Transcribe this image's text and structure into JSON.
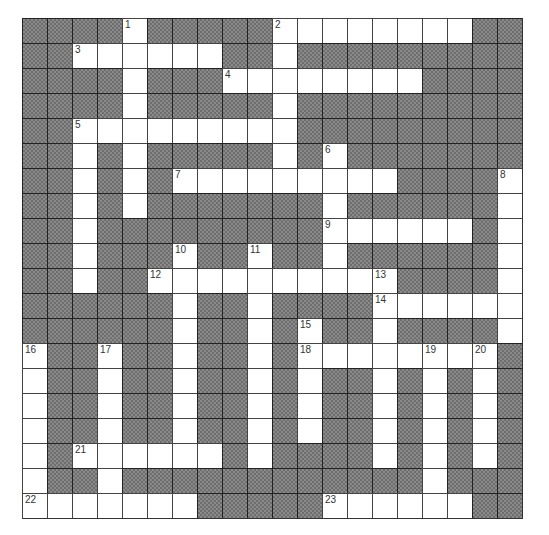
{
  "puzzle": {
    "rows": 20,
    "cols": 20,
    "colors": {
      "block": "#8a8a8a",
      "cell": "#ffffff",
      "line": "#444444"
    },
    "open_cells": {
      "0": [
        4,
        10,
        11,
        12,
        13,
        14,
        15,
        16,
        17
      ],
      "1": [
        2,
        3,
        4,
        5,
        6,
        7,
        10
      ],
      "2": [
        4,
        8,
        9,
        10,
        11,
        12,
        13,
        14,
        15
      ],
      "3": [
        4,
        10
      ],
      "4": [
        2,
        3,
        4,
        5,
        6,
        7,
        8,
        9,
        10
      ],
      "5": [
        2,
        4,
        10,
        12
      ],
      "6": [
        2,
        4,
        6,
        7,
        8,
        9,
        10,
        11,
        12,
        13,
        14,
        19
      ],
      "7": [
        2,
        4,
        12,
        19
      ],
      "8": [
        2,
        12,
        13,
        14,
        15,
        16,
        17,
        19
      ],
      "9": [
        2,
        6,
        9,
        12,
        19
      ],
      "10": [
        2,
        5,
        6,
        7,
        8,
        9,
        10,
        11,
        12,
        13,
        14,
        19
      ],
      "11": [
        6,
        9,
        14,
        15,
        16,
        17,
        18,
        19
      ],
      "12": [
        6,
        9,
        11,
        14,
        19
      ],
      "13": [
        0,
        3,
        6,
        9,
        11,
        12,
        13,
        14,
        15,
        16,
        17,
        18
      ],
      "14": [
        0,
        3,
        6,
        9,
        11,
        14,
        16,
        18
      ],
      "15": [
        0,
        3,
        6,
        9,
        11,
        14,
        16,
        18
      ],
      "16": [
        0,
        3,
        6,
        9,
        11,
        14,
        16,
        18
      ],
      "17": [
        0,
        2,
        3,
        4,
        5,
        6,
        7,
        9,
        14,
        16,
        18
      ],
      "18": [
        0,
        3,
        16
      ],
      "19": [
        0,
        1,
        2,
        3,
        4,
        5,
        6,
        12,
        13,
        14,
        15,
        16,
        17
      ]
    },
    "numbers": [
      {
        "n": "1",
        "row": 0,
        "col": 4
      },
      {
        "n": "2",
        "row": 0,
        "col": 10
      },
      {
        "n": "3",
        "row": 1,
        "col": 2
      },
      {
        "n": "4",
        "row": 2,
        "col": 8
      },
      {
        "n": "5",
        "row": 4,
        "col": 2
      },
      {
        "n": "6",
        "row": 5,
        "col": 12
      },
      {
        "n": "7",
        "row": 6,
        "col": 6
      },
      {
        "n": "8",
        "row": 6,
        "col": 19
      },
      {
        "n": "9",
        "row": 8,
        "col": 12
      },
      {
        "n": "10",
        "row": 9,
        "col": 6
      },
      {
        "n": "11",
        "row": 9,
        "col": 9
      },
      {
        "n": "12",
        "row": 10,
        "col": 5
      },
      {
        "n": "13",
        "row": 10,
        "col": 14
      },
      {
        "n": "14",
        "row": 11,
        "col": 14
      },
      {
        "n": "15",
        "row": 12,
        "col": 11
      },
      {
        "n": "16",
        "row": 13,
        "col": 0
      },
      {
        "n": "17",
        "row": 13,
        "col": 3
      },
      {
        "n": "18",
        "row": 13,
        "col": 11
      },
      {
        "n": "19",
        "row": 13,
        "col": 16
      },
      {
        "n": "20",
        "row": 13,
        "col": 18
      },
      {
        "n": "21",
        "row": 17,
        "col": 2
      },
      {
        "n": "22",
        "row": 19,
        "col": 0
      },
      {
        "n": "23",
        "row": 19,
        "col": 12
      }
    ]
  }
}
